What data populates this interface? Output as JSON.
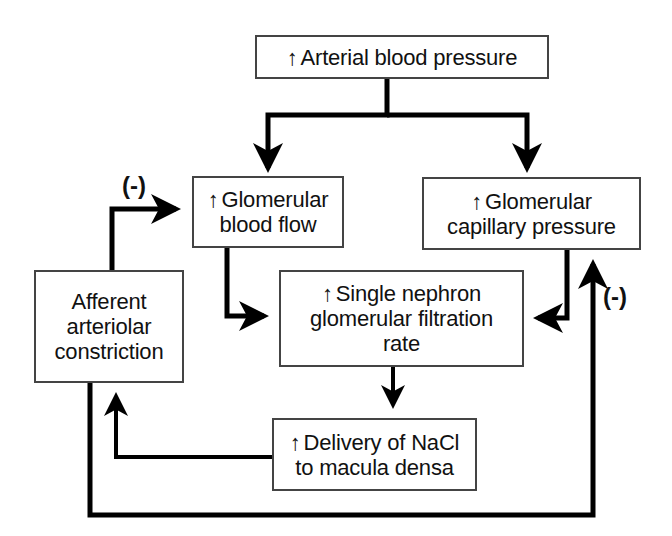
{
  "diagram": {
    "increase_symbol": "↑",
    "negative_feedback_label": "(-)",
    "nodes": {
      "arterial_bp": {
        "lines": [
          "Arterial blood pressure"
        ],
        "increase": true
      },
      "glom_blood_flow": {
        "lines": [
          "Glomerular",
          "blood flow"
        ],
        "increase": true
      },
      "glom_cap_pressure": {
        "lines": [
          "Glomerular",
          "capillary pressure"
        ],
        "increase": true
      },
      "snGFR": {
        "lines": [
          "Single nephron",
          "glomerular filtration",
          "rate"
        ],
        "increase": true
      },
      "nacl_delivery": {
        "lines": [
          "Delivery of NaCl",
          "to macula densa"
        ],
        "increase": true
      },
      "afferent": {
        "lines": [
          "Afferent",
          "arteriolar",
          "constriction"
        ],
        "increase": false
      }
    },
    "edges": [
      {
        "from": "arterial_bp",
        "to": "glom_blood_flow",
        "sign": "+"
      },
      {
        "from": "arterial_bp",
        "to": "glom_cap_pressure",
        "sign": "+"
      },
      {
        "from": "glom_blood_flow",
        "to": "snGFR",
        "sign": "+"
      },
      {
        "from": "glom_cap_pressure",
        "to": "snGFR",
        "sign": "+"
      },
      {
        "from": "snGFR",
        "to": "nacl_delivery",
        "sign": "+"
      },
      {
        "from": "nacl_delivery",
        "to": "afferent",
        "sign": "+"
      },
      {
        "from": "afferent",
        "to": "glom_blood_flow",
        "sign": "-"
      },
      {
        "from": "afferent",
        "to": "glom_cap_pressure",
        "sign": "-"
      }
    ],
    "colors": {
      "line": "#000000",
      "box_border": "#444444",
      "text": "#111111"
    }
  }
}
